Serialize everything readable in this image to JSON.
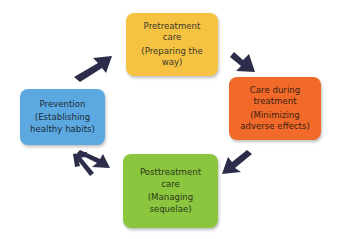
{
  "diagram": {
    "type": "cycle",
    "arrow_color": "#2B2D4A",
    "nodes": [
      {
        "id": "pretreatment",
        "title": "Pretreatment care",
        "title_lines": [
          "Pretreatment",
          "care"
        ],
        "subtitle": "(Preparing the way)",
        "subtitle_lines": [
          "(Preparing the",
          "way)"
        ],
        "color": "#F5C242",
        "text_color": "#3A3A2A"
      },
      {
        "id": "care-during",
        "title": "Care during treatment",
        "title_lines": [
          "Care during",
          "treatment"
        ],
        "subtitle": "(Minimizing adverse effects)",
        "subtitle_lines": [
          "(Minimizing",
          "adverse effects)"
        ],
        "color": "#F26A2A",
        "text_color": "#3A1E10"
      },
      {
        "id": "posttreatment",
        "title": "Posttreatment care",
        "title_lines": [
          "Posttreatment",
          "care"
        ],
        "subtitle": "(Managing sequelae)",
        "subtitle_lines": [
          "(Managing",
          "sequelae)"
        ],
        "color": "#8CC63F",
        "text_color": "#2A3A1A"
      },
      {
        "id": "prevention",
        "title": "Prevention",
        "title_lines": [
          "Prevention"
        ],
        "subtitle": "(Establishing healthy habits)",
        "subtitle_lines": [
          "(Establishing",
          "healthy habits)"
        ],
        "color": "#5BA9E0",
        "text_color": "#1E2A3A"
      }
    ],
    "edges": [
      {
        "from": "pretreatment",
        "to": "care-during"
      },
      {
        "from": "care-during",
        "to": "posttreatment"
      },
      {
        "from": "posttreatment",
        "to": "prevention"
      },
      {
        "from": "prevention",
        "to": "pretreatment"
      }
    ]
  }
}
